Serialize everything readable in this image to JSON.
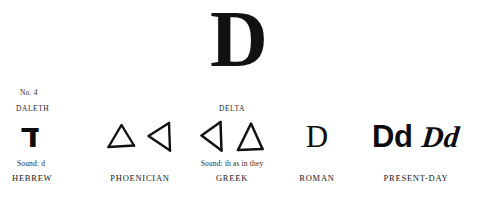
{
  "figure": {
    "number_label": "No. 4",
    "hero_letter": "D"
  },
  "columns": [
    {
      "id": "hebrew",
      "title": "DALETH",
      "glyphs": [
        "ד"
      ],
      "glyph_names": [
        "hebrew-letter-dalet"
      ],
      "sound": "Sound: d",
      "label": "HEBREW"
    },
    {
      "id": "phoenician",
      "title": "",
      "glyphs": [
        "△",
        "◁"
      ],
      "glyph_names": [
        "triangle-up-outline",
        "triangle-left-outline"
      ],
      "sound": "",
      "label": "PHOENICIAN"
    },
    {
      "id": "greek",
      "title": "DELTA",
      "glyphs": [
        "◁",
        "△"
      ],
      "glyph_names": [
        "triangle-left-outline",
        "triangle-up-outline"
      ],
      "sound": "Sound: th as in they",
      "label": "GREEK"
    },
    {
      "id": "roman",
      "title": "",
      "glyphs": [
        "D"
      ],
      "glyph_names": [
        "roman-capital-d"
      ],
      "sound": "",
      "label": "ROMAN"
    },
    {
      "id": "present_day",
      "title": "",
      "glyphs": [
        "Dd",
        "Dd"
      ],
      "glyph_names": [
        "print-letter-dd",
        "script-letter-dd"
      ],
      "sound": "",
      "label": "PRESENT-DAY"
    }
  ],
  "colors": {
    "background": "#ffffff",
    "ink": "#111111",
    "caption_ink": "#2b2b2b"
  }
}
